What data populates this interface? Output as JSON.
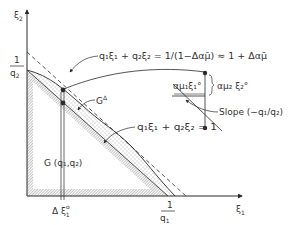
{
  "diagram": {
    "axes": {
      "y_label": "ξ",
      "y_label_sub": "2",
      "x_label": "ξ",
      "x_label_sub": "1"
    },
    "ticks": {
      "y_tick_num": "1",
      "y_tick_den": "q",
      "y_tick_den_sub": "2",
      "x_tick_num": "1",
      "x_tick_den": "q",
      "x_tick_den_sub": "1"
    },
    "labels": {
      "outer_line": "q₁ξ₁ + q₂ξ₂ = 1/(1−Δαμ̄) ≈ 1 + Δαμ̄",
      "budget_line": "q₁ξ₁ + q₂ξ₂ = 1",
      "region_g_delta": "G",
      "region_g_delta_sup": "Δ",
      "region_g": "G (q₁,q₂)",
      "delta_xi": "Δ ξ",
      "delta_xi_sup": "o",
      "delta_xi_sub": "1",
      "inset_horizontal": "αμ₁ξ₁°",
      "inset_vertical": "αμ₂ ξ₂°",
      "slope": "Slope  (−q₁/q₂)"
    },
    "colors": {
      "ink": "#2a2a2a",
      "hatch": "#8a8a8a",
      "stipple": "#555555",
      "background": "#ffffff"
    }
  }
}
